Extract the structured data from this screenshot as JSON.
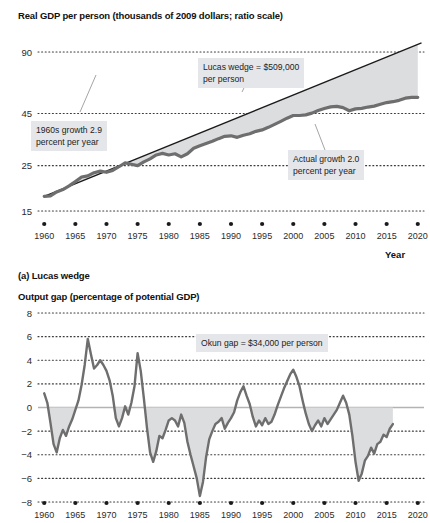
{
  "figure": {
    "top_title": "Real GDP per person (thousands of 2009 dollars; ratio scale)",
    "caption_a": "(a) Lucas wedge",
    "bottom_title": "Output gap (percentage of potential GDP)",
    "x_axis_name": "Year"
  },
  "annotations": {
    "lucas_wedge": "Lucas wedge = $509,000\nper person",
    "growth_1960s": "1960s growth 2.9\npercent per year",
    "actual_growth": "Actual growth 2.0\npercent per year",
    "okun_gap": "Okun gap = $34,000 per person"
  },
  "colors": {
    "line": "#6e6e6e",
    "trend": "#1a1a1a",
    "wedge_fill": "#dcdddf",
    "gridline": "#3a3a3a",
    "annotation_bg": "#e4e6e9",
    "text": "#1a1a1a"
  },
  "chart_data": [
    {
      "type": "line",
      "title": "Real GDP per person (thousands of 2009 dollars; ratio scale)",
      "xlabel": "Year",
      "ylabel": "",
      "scale": "log",
      "grid": true,
      "legend": "none",
      "xlim": [
        1959,
        2021
      ],
      "ylim": [
        15,
        90
      ],
      "ytick_labels": [
        "90",
        "45",
        "25",
        "15"
      ],
      "ytick_values": [
        90,
        45,
        25,
        15
      ],
      "xtick_labels": [
        "1960",
        "1965",
        "1970",
        "1975",
        "1980",
        "1985",
        "1990",
        "1995",
        "2000",
        "2005",
        "2010",
        "2015",
        "2020"
      ],
      "xtick_values": [
        1960,
        1965,
        1970,
        1975,
        1980,
        1985,
        1990,
        1995,
        2000,
        2005,
        2010,
        2015,
        2020
      ],
      "series": [
        {
          "name": "Actual real GDP per person",
          "x": [
            1960,
            1961,
            1962,
            1963,
            1964,
            1965,
            1966,
            1967,
            1968,
            1969,
            1970,
            1971,
            1972,
            1973,
            1974,
            1975,
            1976,
            1977,
            1978,
            1979,
            1980,
            1981,
            1982,
            1983,
            1984,
            1985,
            1986,
            1987,
            1988,
            1989,
            1990,
            1991,
            1992,
            1993,
            1994,
            1995,
            1996,
            1997,
            1998,
            1999,
            2000,
            2001,
            2002,
            2003,
            2004,
            2005,
            2006,
            2007,
            2008,
            2009,
            2010,
            2011,
            2012,
            2013,
            2014,
            2015,
            2016,
            2017,
            2018,
            2019,
            2020
          ],
          "values": [
            17.7,
            17.8,
            18.6,
            19.1,
            19.9,
            20.9,
            22.0,
            22.3,
            23.1,
            23.5,
            23.2,
            23.7,
            24.7,
            25.8,
            25.4,
            25.0,
            26.1,
            27.0,
            28.2,
            28.7,
            28.2,
            28.6,
            27.6,
            28.6,
            30.4,
            31.3,
            32.1,
            32.9,
            33.9,
            34.8,
            35.0,
            34.4,
            35.2,
            35.8,
            36.8,
            37.4,
            38.5,
            39.8,
            41.2,
            42.7,
            44.0,
            44.0,
            44.3,
            45.2,
            46.5,
            47.6,
            48.5,
            48.8,
            48.1,
            46.4,
            47.4,
            47.7,
            48.4,
            48.9,
            49.9,
            50.9,
            51.4,
            52.2,
            53.5,
            54.0,
            54.0
          ],
          "units": "thousands of 2009 dollars per person",
          "color": "#6e6e6e"
        },
        {
          "name": "1960s trend growth 2.9 percent per year",
          "x": [
            1960,
            2020
          ],
          "values": [
            17.7,
            98.0
          ],
          "units": "thousands of 2009 dollars per person",
          "color": "#1a1a1a"
        }
      ],
      "shaded_region": {
        "name": "Lucas wedge",
        "between": [
          "1960s trend growth 2.9 percent per year",
          "Actual real GDP per person"
        ],
        "fill": "#dcdddf",
        "value": "$509,000 per person"
      }
    },
    {
      "type": "line",
      "title": "Output gap (percentage of potential GDP)",
      "xlabel": "Year",
      "ylabel": "",
      "grid": true,
      "legend": "none",
      "xlim": [
        1959,
        2021
      ],
      "ylim": [
        -8,
        8
      ],
      "ytick_labels": [
        "8",
        "6",
        "4",
        "2",
        "0",
        "−2",
        "−4",
        "−6",
        "−8"
      ],
      "ytick_values": [
        8,
        6,
        4,
        2,
        0,
        -2,
        -4,
        -6,
        -8
      ],
      "xtick_labels": [
        "1960",
        "1965",
        "1970",
        "1975",
        "1980",
        "1985",
        "1990",
        "1995",
        "2000",
        "2005",
        "2010",
        "2015",
        "2020"
      ],
      "xtick_values": [
        1960,
        1965,
        1970,
        1975,
        1980,
        1985,
        1990,
        1995,
        2000,
        2005,
        2010,
        2015,
        2020
      ],
      "series": [
        {
          "name": "Output gap",
          "x": [
            1960.0,
            1960.5,
            1961.0,
            1961.5,
            1962.0,
            1962.5,
            1963.0,
            1963.5,
            1964.0,
            1964.5,
            1965.0,
            1965.5,
            1966.0,
            1966.5,
            1967.0,
            1967.5,
            1968.0,
            1968.5,
            1969.0,
            1969.5,
            1970.0,
            1970.5,
            1971.0,
            1971.5,
            1972.0,
            1972.5,
            1973.0,
            1973.5,
            1974.0,
            1974.5,
            1975.0,
            1975.5,
            1976.0,
            1976.5,
            1977.0,
            1977.5,
            1978.0,
            1978.5,
            1979.0,
            1979.5,
            1980.0,
            1980.5,
            1981.0,
            1981.5,
            1982.0,
            1982.5,
            1983.0,
            1983.5,
            1984.0,
            1984.5,
            1985.0,
            1985.5,
            1986.0,
            1986.5,
            1987.0,
            1987.5,
            1988.0,
            1988.5,
            1989.0,
            1989.5,
            1990.0,
            1990.5,
            1991.0,
            1991.5,
            1992.0,
            1992.5,
            1993.0,
            1993.5,
            1994.0,
            1994.5,
            1995.0,
            1995.5,
            1996.0,
            1996.5,
            1997.0,
            1997.5,
            1998.0,
            1998.5,
            1999.0,
            1999.5,
            2000.0,
            2000.5,
            2001.0,
            2001.5,
            2002.0,
            2002.5,
            2003.0,
            2003.5,
            2004.0,
            2004.5,
            2005.0,
            2005.5,
            2006.0,
            2006.5,
            2007.0,
            2007.5,
            2008.0,
            2008.5,
            2009.0,
            2009.5,
            2010.0,
            2010.5,
            2011.0,
            2011.5,
            2012.0,
            2012.5,
            2013.0,
            2013.5,
            2014.0,
            2014.5,
            2015.0,
            2015.5,
            2016.0
          ],
          "values": [
            1.2,
            0.4,
            -1.3,
            -3.1,
            -3.8,
            -2.6,
            -1.9,
            -2.4,
            -1.6,
            -1.0,
            -0.2,
            0.6,
            1.9,
            3.6,
            5.8,
            4.5,
            3.3,
            3.6,
            4.0,
            3.6,
            3.1,
            2.3,
            1.0,
            -0.9,
            -1.6,
            -0.9,
            0.1,
            -0.6,
            0.4,
            1.8,
            4.6,
            3.1,
            0.8,
            -1.7,
            -3.8,
            -4.6,
            -3.7,
            -2.4,
            -2.6,
            -1.9,
            -1.1,
            -0.9,
            -1.1,
            -1.6,
            -0.6,
            -1.3,
            -2.9,
            -4.0,
            -5.0,
            -6.0,
            -7.5,
            -6.3,
            -4.2,
            -2.7,
            -2.0,
            -1.4,
            -1.2,
            -0.9,
            -1.8,
            -1.3,
            -0.9,
            -0.4,
            0.6,
            1.3,
            1.8,
            1.0,
            0.3,
            -0.8,
            -1.6,
            -1.1,
            -1.5,
            -0.9,
            -1.4,
            -1.2,
            -0.6,
            0.2,
            0.9,
            1.6,
            2.2,
            2.8,
            3.2,
            2.6,
            1.8,
            0.6,
            -0.5,
            -1.4,
            -2.0,
            -1.5,
            -1.1,
            -1.6,
            -0.9,
            -1.4,
            -1.0,
            -0.6,
            -0.2,
            0.4,
            1.0,
            0.4,
            -0.6,
            -2.4,
            -4.6,
            -6.2,
            -5.6,
            -4.5,
            -4.1,
            -3.4,
            -3.9,
            -3.1,
            -2.9,
            -2.3,
            -2.5,
            -1.8,
            -1.4,
            -1.0,
            -1.4
          ],
          "units": "percent of potential GDP",
          "color": "#6e6e6e"
        }
      ],
      "shaded_region": {
        "name": "Okun gap",
        "between": [
          "zero line",
          "Output gap (negative portion)"
        ],
        "fill": "#dcdddf",
        "value": "$34,000 per person"
      }
    }
  ]
}
